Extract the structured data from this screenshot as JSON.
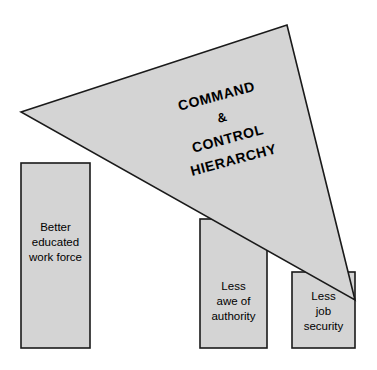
{
  "diagram": {
    "type": "concept-diagram",
    "colors": {
      "shape_fill": "#d4d4d4",
      "shape_stroke": "#1a1a1a",
      "background": "#ffffff",
      "text": "#000000"
    },
    "roof": {
      "name": "command-and-control-hierarchy",
      "rotation_degrees": -15,
      "lines": [
        "COMMAND",
        "&",
        "CONTROL",
        "HIERARCHY"
      ],
      "vertices": {
        "left": [
          21,
          112
        ],
        "apex": [
          287,
          25
        ],
        "bottom_right": [
          355,
          300
        ]
      }
    },
    "pillars": [
      {
        "name": "pillar-better-educated-work-force",
        "lines": [
          "Better",
          "educated",
          "work force"
        ],
        "x": 21,
        "width": 69,
        "top": 163,
        "bottom": 348
      },
      {
        "name": "pillar-less-awe-of-authority",
        "lines": [
          "Less",
          "awe of",
          "authority"
        ],
        "x": 200,
        "width": 67,
        "top": 219,
        "bottom": 348
      },
      {
        "name": "pillar-less-job-security",
        "lines": [
          "Less",
          "job",
          "security"
        ],
        "x": 292,
        "width": 63,
        "top": 272,
        "bottom": 348
      }
    ]
  }
}
